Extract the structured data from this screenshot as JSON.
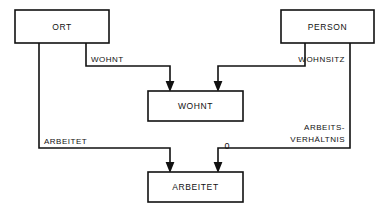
{
  "diagram": {
    "stroke_color": "#111111",
    "background_color": "#ffffff",
    "entities": [
      {
        "id": "ort",
        "label": "ORT",
        "x": 15,
        "y": 10,
        "w": 94,
        "h": 33
      },
      {
        "id": "person",
        "label": "PERSON",
        "x": 281,
        "y": 10,
        "w": 93,
        "h": 33
      },
      {
        "id": "wohnt_rel",
        "label": "WOHNT",
        "x": 148,
        "y": 91,
        "w": 95,
        "h": 30
      },
      {
        "id": "arbeitet_rel",
        "label": "ARBEITET",
        "x": 148,
        "y": 172,
        "w": 95,
        "h": 30
      }
    ],
    "edges": [
      {
        "id": "ort-wohnt",
        "label": "WOHNT",
        "label_x": 91,
        "label_y": 62,
        "label_anchor": "start",
        "from": "ort",
        "to": "wohnt_rel"
      },
      {
        "id": "person-wohnsitz",
        "label": "WOHNSITZ",
        "label_x": 345,
        "label_y": 62,
        "label_anchor": "end",
        "from": "person",
        "to": "wohnt_rel"
      },
      {
        "id": "ort-arbeitet",
        "label": "ARBEITET",
        "label_x": 44,
        "label_y": 144,
        "label_anchor": "start",
        "from": "ort",
        "to": "arbeitet_rel"
      },
      {
        "id": "person-arbeitsverhaeltnis",
        "label_line_1": "ARBEITS-",
        "label_line_2": "VERHÄLTNIS",
        "label_x": 345,
        "label_y_1": 130,
        "label_y_2": 142,
        "label_anchor": "end",
        "from": "person",
        "to": "arbeitet_rel"
      }
    ],
    "annotations": [
      {
        "id": "cardinality-zero",
        "text": "0",
        "x": 227,
        "y": 149
      }
    ]
  }
}
